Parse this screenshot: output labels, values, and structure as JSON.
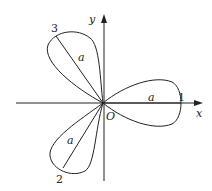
{
  "diagram": {
    "type": "three-leaf rose (polar curve)",
    "axes": {
      "x_label": "x",
      "y_label": "y",
      "origin_label": "O"
    },
    "petals": [
      {
        "id": "1",
        "label": "1",
        "length_label": "a",
        "direction": "positive x-axis"
      },
      {
        "id": "2",
        "label": "2",
        "length_label": "a",
        "direction": "lower-left"
      },
      {
        "id": "3",
        "label": "3",
        "length_label": "a",
        "direction": "upper-left"
      }
    ]
  }
}
